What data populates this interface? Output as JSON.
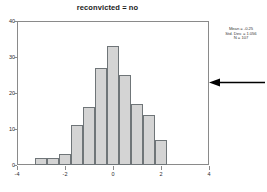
{
  "chart_data": {
    "type": "bar",
    "title": "reconvicted = no",
    "xlabel": "",
    "ylabel": "",
    "grid": false,
    "legend": "none",
    "xlim": [
      -4,
      4
    ],
    "ylim": [
      0,
      40
    ],
    "x_ticks": [
      "-4",
      "-2",
      "0",
      "2",
      "4"
    ],
    "x_tick_values": [
      -4,
      -2,
      0,
      2,
      4
    ],
    "y_ticks": [
      "0",
      "10",
      "20",
      "30",
      "40"
    ],
    "y_tick_values": [
      0,
      10,
      20,
      30,
      40
    ],
    "bin_width": 0.5,
    "bin_starts": [
      -3.25,
      -2.75,
      -2.25,
      -1.75,
      -1.25,
      -0.75,
      -0.25,
      0.25,
      0.75,
      1.25,
      1.75
    ],
    "categories": [
      "-3.25",
      "-2.75",
      "-2.25",
      "-1.75",
      "-1.25",
      "-0.75",
      "-0.25",
      "0.25",
      "0.75",
      "1.25",
      "1.75"
    ],
    "values": [
      2,
      2,
      3,
      11,
      16,
      27,
      33,
      25,
      17,
      14,
      7
    ],
    "bar_fill_color": "#d4d4d4",
    "bar_edge_color": "#6f7578"
  },
  "statistics": {
    "mean_label": "Mean = -0.25",
    "std_dev_label": "Std. Dev. = 1.056",
    "n_label": "N = 107",
    "mean": -0.25,
    "std_dev": 1.056,
    "n": 107
  },
  "annotation": {
    "arrow_direction": "left",
    "arrow_color": "#000000"
  }
}
